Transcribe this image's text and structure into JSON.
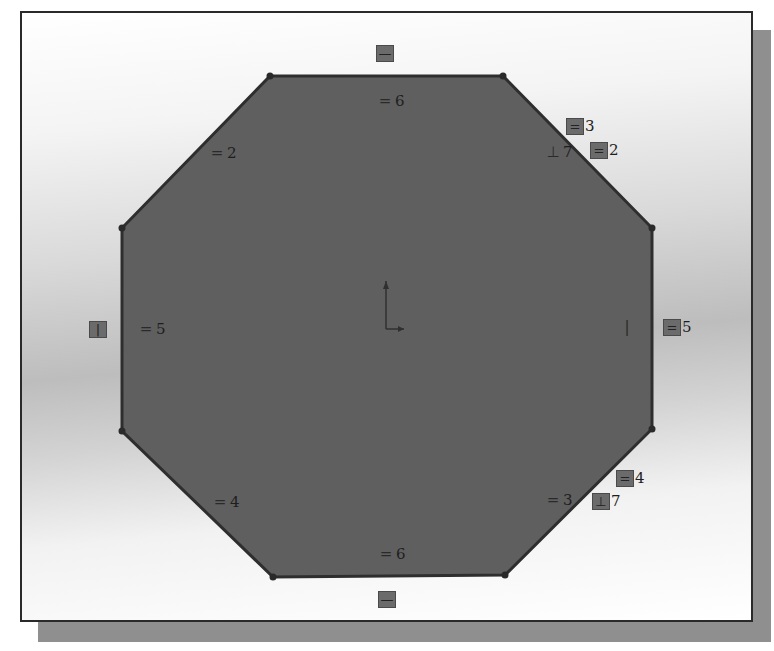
{
  "view": {
    "type": "cad-sketch",
    "shape": "regular-octagon",
    "colors": {
      "frame_border": "#2a2a2a",
      "frame_shadow": "#8f8f8f",
      "shape_fill": "#5f5f5f",
      "shape_edge": "#2e2e2e",
      "relation_glyph": "#6b6b6b"
    },
    "vertices": [
      [
        248,
        63
      ],
      [
        481,
        63
      ],
      [
        630,
        215
      ],
      [
        630,
        416
      ],
      [
        483,
        562
      ],
      [
        251,
        564
      ],
      [
        100,
        418
      ],
      [
        100,
        215
      ]
    ]
  },
  "relations": [
    {
      "id": "top-horizontal",
      "glyph": "—",
      "label": "",
      "x": 354,
      "y": 32,
      "boxed": true
    },
    {
      "id": "top-equal",
      "glyph": "=",
      "label": "6",
      "x": 354,
      "y": 80,
      "boxed": false
    },
    {
      "id": "upper-left-equal",
      "glyph": "=",
      "label": "2",
      "x": 186,
      "y": 132,
      "boxed": false
    },
    {
      "id": "upper-right-equal-3",
      "glyph": "=",
      "label": "3",
      "x": 544,
      "y": 105,
      "boxed": true
    },
    {
      "id": "upper-right-perp",
      "glyph": "⊥",
      "label": "7",
      "x": 522,
      "y": 131,
      "boxed": false
    },
    {
      "id": "upper-right-equal-2",
      "glyph": "=",
      "label": "2",
      "x": 568,
      "y": 129,
      "boxed": true
    },
    {
      "id": "left-vertical",
      "glyph": "|",
      "label": "",
      "x": 67,
      "y": 308,
      "boxed": true
    },
    {
      "id": "left-equal",
      "glyph": "=",
      "label": "5",
      "x": 115,
      "y": 308,
      "boxed": false
    },
    {
      "id": "right-vertical",
      "glyph": "|",
      "label": "",
      "x": 596,
      "y": 306,
      "boxed": false
    },
    {
      "id": "right-equal",
      "glyph": "=",
      "label": "5",
      "x": 641,
      "y": 306,
      "boxed": true
    },
    {
      "id": "lower-right-equal-4",
      "glyph": "=",
      "label": "4",
      "x": 594,
      "y": 457,
      "boxed": true
    },
    {
      "id": "lower-right-equal-3",
      "glyph": "=",
      "label": "3",
      "x": 522,
      "y": 479,
      "boxed": false
    },
    {
      "id": "lower-right-perp",
      "glyph": "⊥",
      "label": "7",
      "x": 570,
      "y": 480,
      "boxed": true
    },
    {
      "id": "lower-left-equal",
      "glyph": "=",
      "label": "4",
      "x": 189,
      "y": 481,
      "boxed": false
    },
    {
      "id": "bottom-equal",
      "glyph": "=",
      "label": "6",
      "x": 355,
      "y": 533,
      "boxed": false
    },
    {
      "id": "bottom-horizontal",
      "glyph": "—",
      "label": "",
      "x": 356,
      "y": 578,
      "boxed": true
    }
  ],
  "origin": {
    "x": 364,
    "y": 316,
    "y_axis_len": 48,
    "x_axis_len": 18
  }
}
